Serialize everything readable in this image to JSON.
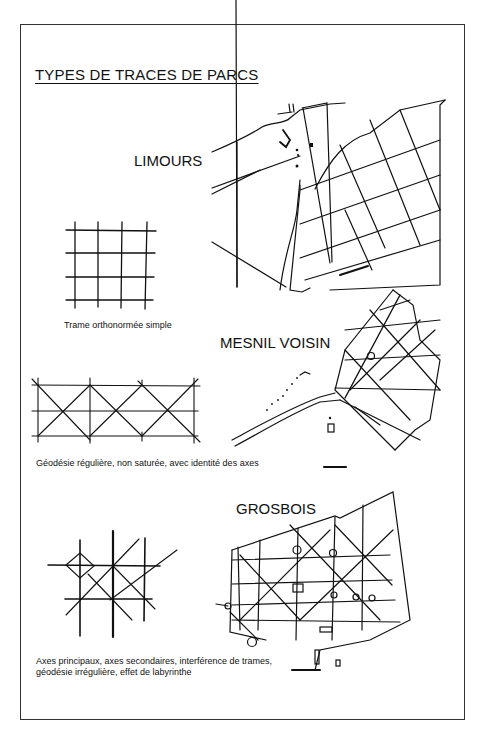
{
  "page": {
    "title": "TYPES DE TRACES DE PARCS"
  },
  "parks": [
    {
      "name": "LIMOURS",
      "scale_label": "scale bar"
    },
    {
      "name": "MESNIL VOISIN",
      "scale_label": "scale bar"
    },
    {
      "name": "GROSBOIS",
      "scale_label": "scale bar"
    }
  ],
  "schemas": [
    {
      "caption": "Trame orthonormée simple"
    },
    {
      "caption": "Géodésie régulière, non saturée, avec identité des axes"
    },
    {
      "caption_line1": "Axes principaux, axes secondaires, interférence de trames,",
      "caption_line2": "géodésie irrégulière, effet de labyrinthe"
    }
  ],
  "colors": {
    "ink": "#111111",
    "paper": "#ffffff",
    "frame": "#333333"
  }
}
